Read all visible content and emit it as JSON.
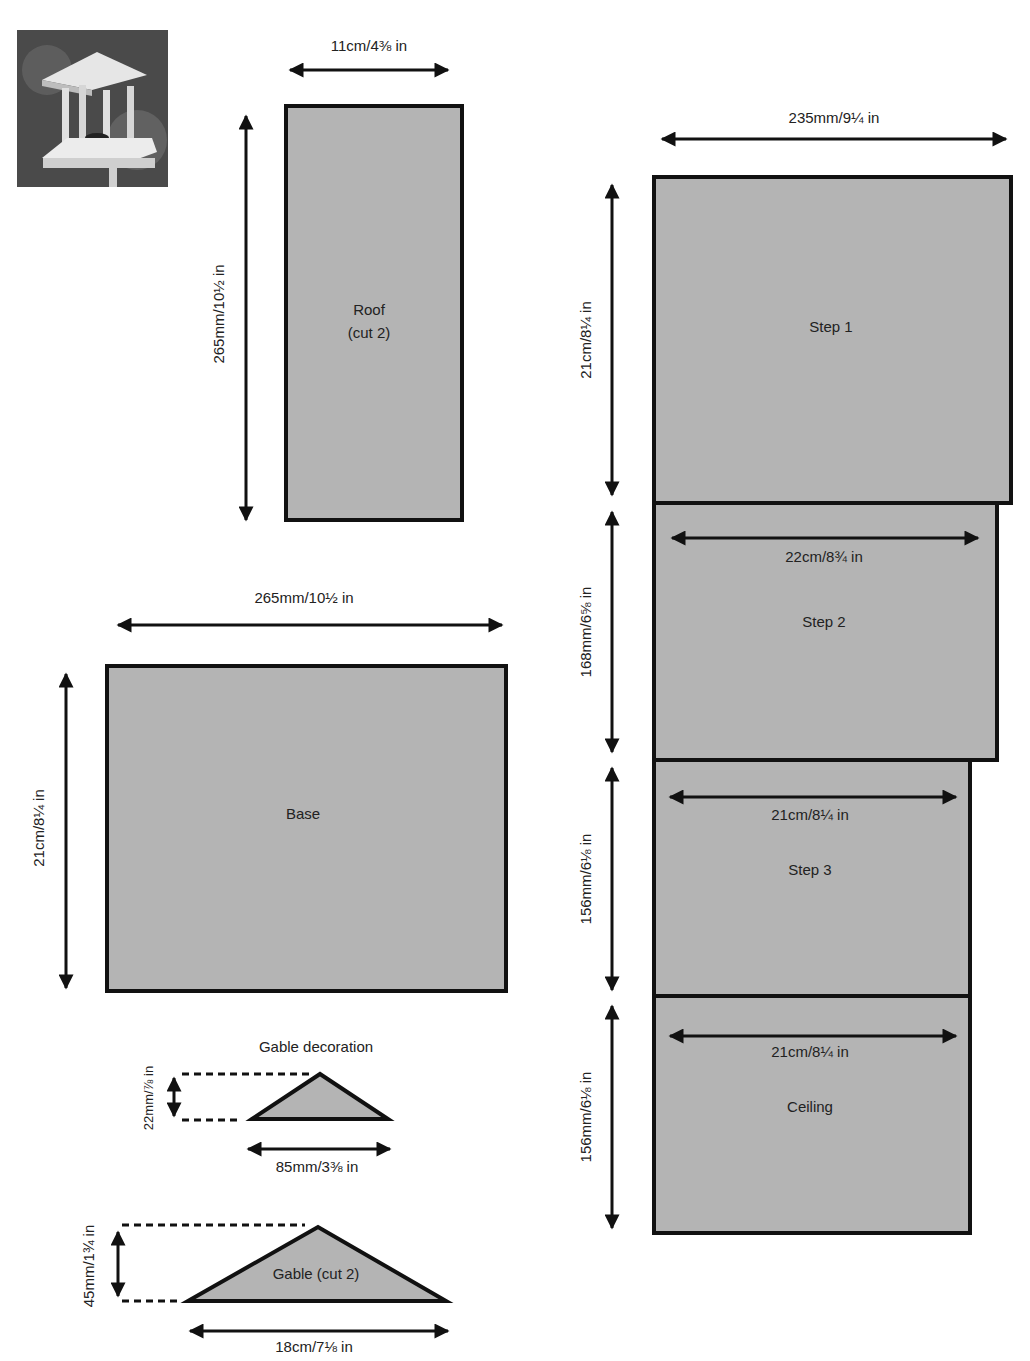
{
  "header": {
    "caption": ""
  },
  "photo": {
    "alt": "Finished bird table with classical columns and roof"
  },
  "pieces": {
    "roof": {
      "name": "Roof",
      "note": "(cut 2)",
      "width": "11cm/4⅜ in",
      "height": "265mm/10½ in"
    },
    "base": {
      "name": "Base",
      "width": "265mm/10½ in",
      "height": "21cm/8¼ in"
    },
    "gable_decoration": {
      "name": "Gable decoration",
      "width": "85mm/3⅜ in",
      "height": "22mm/⅞ in"
    },
    "gable": {
      "name": "Gable (cut 2)",
      "width": "18cm/7⅛ in",
      "height": "45mm/1¾ in"
    },
    "step1": {
      "name": "Step 1",
      "width": "235mm/9¼ in",
      "height": "21cm/8¼ in"
    },
    "step2": {
      "name": "Step 2",
      "width": "22cm/8¾ in",
      "height": "168mm/6⅝ in"
    },
    "step3": {
      "name": "Step 3",
      "width": "21cm/8¼ in",
      "height": "156mm/6⅛ in"
    },
    "ceiling": {
      "name": "Ceiling",
      "width": "21cm/8¼ in",
      "height": "156mm/6⅛ in"
    }
  },
  "colors": {
    "panel_fill": "#b4b4b4",
    "outline": "#111111",
    "background": "#ffffff"
  }
}
